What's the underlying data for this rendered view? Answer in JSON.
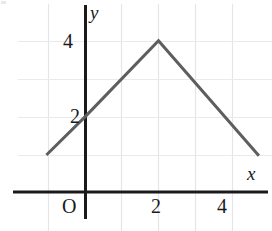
{
  "figure": {
    "title": "",
    "background_color": "#ffffff"
  },
  "axes": {
    "x_axis_label": "x",
    "y_axis_label": "y",
    "origin_label": "O",
    "axis_color": "#1a1a1a",
    "grid_color": "#e4e4ea",
    "x_tick_labels": [
      "2",
      "4"
    ],
    "y_tick_labels": [
      "2",
      "4"
    ]
  },
  "curve": {
    "color": "#5e5e5e",
    "width": 3
  },
  "chart_data": {
    "type": "line",
    "title": "",
    "xlabel": "x",
    "ylabel": "y",
    "grid": true,
    "legend": null,
    "xlim": [
      -1.1,
      5.0
    ],
    "ylim": [
      0,
      4.8
    ],
    "xticks": [
      2,
      4
    ],
    "yticks": [
      2,
      4
    ],
    "xtick_labels": [
      "2",
      "4"
    ],
    "ytick_labels": [
      "2",
      "4"
    ],
    "gridlines_x": [
      -1,
      0,
      1,
      2,
      3,
      4
    ],
    "gridlines_y": [
      1,
      2,
      3,
      4
    ],
    "series": [
      {
        "name": "piecewise-linear",
        "color": "#5e5e5e",
        "x": [
          -1.07,
          0,
          2,
          4.75
        ],
        "y": [
          0.98,
          2.0,
          4.0,
          0.96
        ],
        "points": [
          {
            "x": -1.07,
            "y": 0.98
          },
          {
            "x": 0,
            "y": 2.0
          },
          {
            "x": 2,
            "y": 4.0
          },
          {
            "x": 4.75,
            "y": 0.96
          }
        ]
      }
    ],
    "annotations": [
      {
        "text": "O",
        "x": -0.35,
        "y": -0.45,
        "role": "origin-label"
      },
      {
        "text": "x",
        "x": 4.5,
        "y": 0.45,
        "role": "x-axis-label"
      },
      {
        "text": "y",
        "x": 0.3,
        "y": 4.6,
        "role": "y-axis-label"
      }
    ]
  }
}
